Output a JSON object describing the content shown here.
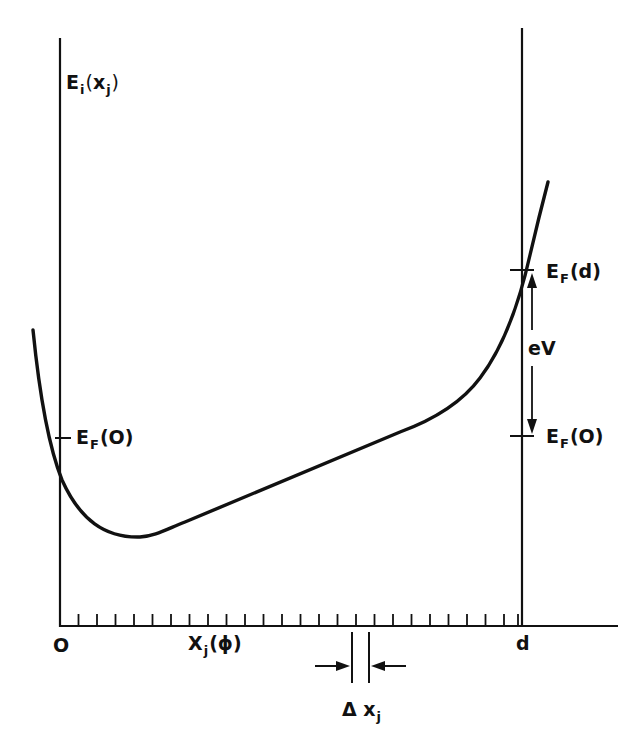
{
  "diagram": {
    "type": "energy-band diagram",
    "colors": {
      "ink": "#111111",
      "background": "#ffffff"
    },
    "y_axis_label": {
      "main": "E",
      "sub": "i",
      "open": "(",
      "arg": "x",
      "arg_sub": "j",
      "close": ")"
    },
    "left_fermi_label": {
      "main": "E",
      "sub": "F",
      "arg": "(O)"
    },
    "right_fermi_top_label": {
      "main": "E",
      "sub": "F",
      "arg": "(d)"
    },
    "right_fermi_bottom_label": {
      "main": "E",
      "sub": "F",
      "arg": "(O)"
    },
    "voltage_label": "eV",
    "x_axis_origin_label": "O",
    "x_axis_end_label": "d",
    "x_axis_label": {
      "main": "X",
      "sub": "j",
      "arg": "(ϕ)"
    },
    "delta_label": {
      "main": "Δ x",
      "sub": "j"
    },
    "tick_count": 25
  }
}
